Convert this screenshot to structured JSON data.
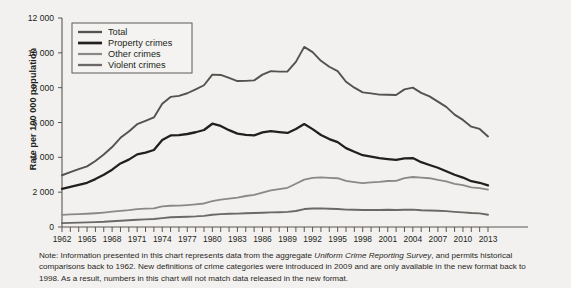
{
  "chart_data": {
    "type": "line",
    "title": "",
    "xlabel": "",
    "ylabel": "Rate per 100 000 population",
    "ylim": [
      0,
      12000
    ],
    "ytick_values": [
      0,
      2000,
      4000,
      6000,
      8000,
      10000,
      12000
    ],
    "ytick_labels": [
      "0",
      "2 000",
      "4 000",
      "6 000",
      "8 000",
      "10 000",
      "12 000"
    ],
    "xlim": [
      1962,
      2013
    ],
    "xtick_labels": [
      "1962",
      "1965",
      "1968",
      "1971",
      "1974",
      "1977",
      "1980",
      "1983",
      "1986",
      "1989",
      "1992",
      "1995",
      "1998",
      "2001",
      "2004",
      "2007",
      "2010",
      "2013"
    ],
    "xtick_values": [
      1962,
      1965,
      1968,
      1971,
      1974,
      1977,
      1980,
      1983,
      1986,
      1989,
      1992,
      1995,
      1998,
      2001,
      2004,
      2007,
      2010,
      2013
    ],
    "grid": false,
    "legend_position": "top-left",
    "x": [
      1962,
      1963,
      1964,
      1965,
      1966,
      1967,
      1968,
      1969,
      1970,
      1971,
      1972,
      1973,
      1974,
      1975,
      1976,
      1977,
      1978,
      1979,
      1980,
      1981,
      1982,
      1983,
      1984,
      1985,
      1986,
      1987,
      1988,
      1989,
      1990,
      1991,
      1992,
      1993,
      1994,
      1995,
      1996,
      1997,
      1998,
      1999,
      2000,
      2001,
      2002,
      2003,
      2004,
      2005,
      2006,
      2007,
      2008,
      2009,
      2010,
      2011,
      2012,
      2013
    ],
    "series": [
      {
        "name": "Total",
        "color": "#54514e",
        "width": 1.9,
        "values": [
          2972,
          3150,
          3320,
          3480,
          3790,
          4160,
          4590,
          5120,
          5480,
          5900,
          6090,
          6290,
          7080,
          7470,
          7530,
          7680,
          7900,
          8140,
          8750,
          8730,
          8560,
          8380,
          8390,
          8420,
          8750,
          8950,
          8920,
          8930,
          9480,
          10342,
          10040,
          9540,
          9200,
          8950,
          8340,
          8000,
          7730,
          7670,
          7600,
          7590,
          7580,
          7900,
          8000,
          7700,
          7500,
          7200,
          6900,
          6450,
          6150,
          5760,
          5630,
          5200
        ]
      },
      {
        "name": "Property crimes",
        "color": "#231f20",
        "width": 2.3,
        "values": [
          2190,
          2300,
          2420,
          2540,
          2750,
          3000,
          3290,
          3650,
          3870,
          4170,
          4270,
          4420,
          4990,
          5260,
          5270,
          5340,
          5440,
          5570,
          5930,
          5800,
          5560,
          5360,
          5290,
          5260,
          5430,
          5510,
          5450,
          5400,
          5630,
          5910,
          5620,
          5280,
          5050,
          4870,
          4530,
          4320,
          4120,
          4040,
          3960,
          3900,
          3850,
          3940,
          3960,
          3720,
          3560,
          3400,
          3200,
          3000,
          2840,
          2630,
          2540,
          2390
        ]
      },
      {
        "name": "Other crimes",
        "color": "#8b8885",
        "width": 1.8,
        "values": [
          700,
          720,
          740,
          760,
          790,
          830,
          880,
          930,
          970,
          1030,
          1050,
          1070,
          1180,
          1220,
          1230,
          1260,
          1300,
          1350,
          1480,
          1570,
          1630,
          1690,
          1780,
          1850,
          1980,
          2100,
          2170,
          2250,
          2480,
          2720,
          2820,
          2850,
          2820,
          2800,
          2650,
          2580,
          2520,
          2560,
          2590,
          2640,
          2650,
          2800,
          2870,
          2840,
          2800,
          2700,
          2620,
          2480,
          2400,
          2270,
          2230,
          2150
        ]
      },
      {
        "name": "Violent crimes",
        "color": "#6b6865",
        "width": 1.9,
        "values": [
          221,
          235,
          250,
          265,
          280,
          300,
          330,
          360,
          390,
          420,
          440,
          460,
          510,
          560,
          570,
          590,
          610,
          640,
          700,
          740,
          760,
          770,
          790,
          800,
          820,
          840,
          850,
          870,
          920,
          1030,
          1060,
          1070,
          1050,
          1030,
          1000,
          990,
          980,
          980,
          980,
          990,
          980,
          990,
          1000,
          960,
          950,
          930,
          910,
          870,
          840,
          800,
          780,
          700
        ]
      }
    ]
  },
  "note": {
    "part1": "Note: Information presented in this chart represents data from the aggregate ",
    "italic": "Uniform Crime Reporting Survey",
    "part2": ", and permits historical comparisons back to 1962. New definitions of crime categories were introduced in 2009 and are only available in the new format back to 1998. As a result, numbers in this chart will not match data released in the new format."
  }
}
